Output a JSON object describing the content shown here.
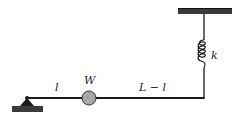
{
  "diagram": {
    "labels": {
      "segment_left": "l",
      "mass": "W",
      "segment_right": "L − l",
      "spring": "k"
    },
    "colors": {
      "line": "#1a1a1a",
      "ground": "#3a3a3a",
      "mass_fill": "#a8a8a8",
      "background": "#ffffff"
    },
    "components": [
      "pin-support",
      "rigid-bar",
      "point-mass",
      "spring",
      "ceiling-support"
    ]
  }
}
